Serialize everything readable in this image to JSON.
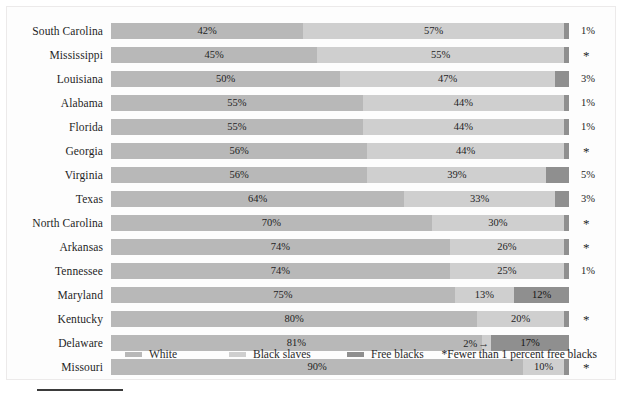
{
  "chart_data": {
    "type": "bar",
    "subtype": "stacked-horizontal-100",
    "title": "",
    "subtitle": "",
    "xlabel": "",
    "ylabel": "",
    "xlim": [
      0,
      100
    ],
    "grid": false,
    "legend_position": "bottom-left",
    "categories": [
      "South Carolina",
      "Mississippi",
      "Louisiana",
      "Alabama",
      "Florida",
      "Georgia",
      "Virginia",
      "Texas",
      "North Carolina",
      "Arkansas",
      "Tennessee",
      "Maryland",
      "Kentucky",
      "Delaware",
      "Missouri"
    ],
    "series": [
      {
        "name": "White",
        "color": "#b8b8b8",
        "values": [
          42,
          45,
          50,
          55,
          55,
          56,
          56,
          64,
          70,
          74,
          74,
          75,
          80,
          81,
          90
        ]
      },
      {
        "name": "Black slaves",
        "color": "#cfcfcf",
        "values": [
          57,
          55,
          47,
          44,
          44,
          44,
          39,
          33,
          30,
          26,
          25,
          13,
          20,
          2,
          10
        ]
      },
      {
        "name": "Free blacks",
        "color": "#8f8f8f",
        "values": [
          1,
          0.5,
          3,
          1,
          1,
          0.5,
          5,
          3,
          0.5,
          0.5,
          1,
          12,
          0.5,
          17,
          0.5
        ]
      }
    ],
    "annotations": [
      {
        "row": "Delaware",
        "text": "2%",
        "arrow": "→",
        "points_to": "Black slaves"
      }
    ],
    "footnote": "*Fewer than 1 percent free blacks"
  },
  "rows": [
    {
      "label": "South Carolina",
      "white": "42%",
      "slaves": "57%",
      "free": "1%",
      "free_star": false,
      "white_pct": 42,
      "slaves_pct": 57,
      "free_pct": 1,
      "free_inside": false,
      "callout": null
    },
    {
      "label": "Mississippi",
      "white": "45%",
      "slaves": "55%",
      "free": "*",
      "free_star": true,
      "white_pct": 45,
      "slaves_pct": 55,
      "free_pct": 0,
      "free_inside": false,
      "callout": null
    },
    {
      "label": "Louisiana",
      "white": "50%",
      "slaves": "47%",
      "free": "3%",
      "free_star": false,
      "white_pct": 50,
      "slaves_pct": 47,
      "free_pct": 3,
      "free_inside": false,
      "callout": null
    },
    {
      "label": "Alabama",
      "white": "55%",
      "slaves": "44%",
      "free": "1%",
      "free_star": false,
      "white_pct": 55,
      "slaves_pct": 44,
      "free_pct": 1,
      "free_inside": false,
      "callout": null
    },
    {
      "label": "Florida",
      "white": "55%",
      "slaves": "44%",
      "free": "1%",
      "free_star": false,
      "white_pct": 55,
      "slaves_pct": 44,
      "free_pct": 1,
      "free_inside": false,
      "callout": null
    },
    {
      "label": "Georgia",
      "white": "56%",
      "slaves": "44%",
      "free": "*",
      "free_star": true,
      "white_pct": 56,
      "slaves_pct": 44,
      "free_pct": 0,
      "free_inside": false,
      "callout": null
    },
    {
      "label": "Virginia",
      "white": "56%",
      "slaves": "39%",
      "free": "5%",
      "free_star": false,
      "white_pct": 56,
      "slaves_pct": 39,
      "free_pct": 5,
      "free_inside": false,
      "callout": null
    },
    {
      "label": "Texas",
      "white": "64%",
      "slaves": "33%",
      "free": "3%",
      "free_star": false,
      "white_pct": 64,
      "slaves_pct": 33,
      "free_pct": 3,
      "free_inside": false,
      "callout": null
    },
    {
      "label": "North Carolina",
      "white": "70%",
      "slaves": "30%",
      "free": "*",
      "free_star": true,
      "white_pct": 70,
      "slaves_pct": 30,
      "free_pct": 0,
      "free_inside": false,
      "callout": null
    },
    {
      "label": "Arkansas",
      "white": "74%",
      "slaves": "26%",
      "free": "*",
      "free_star": true,
      "white_pct": 74,
      "slaves_pct": 26,
      "free_pct": 0,
      "free_inside": false,
      "callout": null
    },
    {
      "label": "Tennessee",
      "white": "74%",
      "slaves": "25%",
      "free": "1%",
      "free_star": false,
      "white_pct": 74,
      "slaves_pct": 25,
      "free_pct": 1,
      "free_inside": false,
      "callout": null
    },
    {
      "label": "Maryland",
      "white": "75%",
      "slaves": "13%",
      "free": "12%",
      "free_star": false,
      "white_pct": 75,
      "slaves_pct": 13,
      "free_pct": 12,
      "free_inside": true,
      "callout": null
    },
    {
      "label": "Kentucky",
      "white": "80%",
      "slaves": "20%",
      "free": "*",
      "free_star": true,
      "white_pct": 80,
      "slaves_pct": 20,
      "free_pct": 0,
      "free_inside": false,
      "callout": null
    },
    {
      "label": "Delaware",
      "white": "81%",
      "slaves": "",
      "free": "17%",
      "free_star": false,
      "white_pct": 81,
      "slaves_pct": 2,
      "free_pct": 17,
      "free_inside": true,
      "callout": {
        "text": "2%",
        "arrow": "→"
      }
    },
    {
      "label": "Missouri",
      "white": "90%",
      "slaves": "10%",
      "free": "*",
      "free_star": true,
      "white_pct": 90,
      "slaves_pct": 10,
      "free_pct": 0,
      "free_inside": false,
      "callout": null
    }
  ],
  "legend": {
    "items": [
      {
        "label": "White",
        "color": "#b8b8b8",
        "swatch_class": "sw-white"
      },
      {
        "label": "Black slaves",
        "color": "#cfcfcf",
        "swatch_class": "sw-slaves"
      },
      {
        "label": "Free blacks",
        "color": "#8f8f8f",
        "swatch_class": "sw-free"
      }
    ],
    "positions": [
      118,
      222,
      340
    ]
  },
  "footnote": {
    "text": "*Fewer than 1 percent free blacks"
  }
}
